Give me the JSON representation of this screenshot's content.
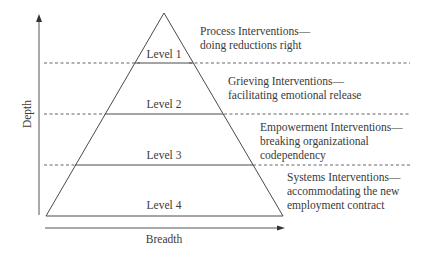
{
  "diagram": {
    "axes": {
      "y_label": "Depth",
      "x_label": "Breadth"
    },
    "levels": [
      {
        "label": "Level 1"
      },
      {
        "label": "Level 2"
      },
      {
        "label": "Level 3"
      },
      {
        "label": "Level 4"
      }
    ],
    "interventions": [
      {
        "title": "Process Interventions—",
        "subtitle": [
          "doing reductions right"
        ]
      },
      {
        "title": "Grieving Interventions—",
        "subtitle": [
          "facilitating emotional release"
        ]
      },
      {
        "title": "Empowerment Interventions—",
        "subtitle": [
          "breaking organizational",
          "codependency"
        ]
      },
      {
        "title": "Systems Interventions—",
        "subtitle": [
          "accommodating the new",
          "employment contract"
        ]
      }
    ],
    "colors": {
      "line": "#4a4a4a",
      "text": "#3a3a3a",
      "background": "#ffffff"
    }
  }
}
